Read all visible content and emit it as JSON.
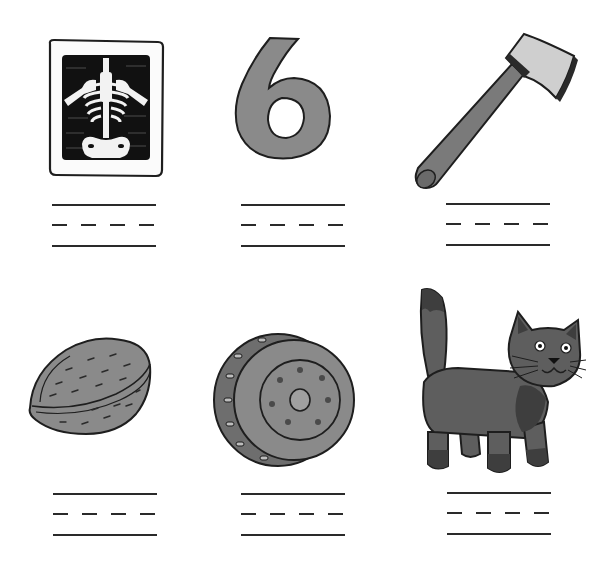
{
  "worksheet": {
    "colors": {
      "ink": "#1e1e1e",
      "gray_fill": "#8a8a8a",
      "dark_gray": "#5a5a5a",
      "light_gray": "#c8c8c8",
      "xray_black": "#111111",
      "line": "#2a2a2a"
    },
    "items": [
      {
        "picture": "x-ray",
        "icon": "xray-icon",
        "answer": ""
      },
      {
        "picture": "six",
        "icon": "number-six-icon",
        "answer": ""
      },
      {
        "picture": "axe",
        "icon": "axe-icon",
        "answer": ""
      },
      {
        "picture": "walnut",
        "icon": "walnut-icon",
        "answer": ""
      },
      {
        "picture": "wheel",
        "icon": "wheel-icon",
        "answer": ""
      },
      {
        "picture": "cat",
        "icon": "cat-icon",
        "answer": ""
      }
    ]
  }
}
